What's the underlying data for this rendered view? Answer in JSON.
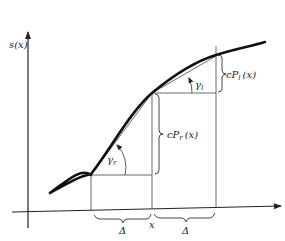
{
  "figure": {
    "y_axis_label": "s(x)",
    "x_axis_point_label": "x",
    "delta_left_label": "Δ",
    "delta_right_label": "Δ",
    "gamma_r_label": "γ",
    "gamma_r_sub": "r",
    "gamma_l_label": "γ",
    "gamma_l_sub": "l",
    "cp_r_label_main": "cP",
    "cp_r_sub": "r",
    "cp_r_arg": "(x)",
    "cp_l_label_main": "cP",
    "cp_l_sub": "l",
    "cp_l_arg": "(x)"
  },
  "colors": {
    "curve": "#111111",
    "lines": "#333333",
    "background": "#ffffff"
  }
}
